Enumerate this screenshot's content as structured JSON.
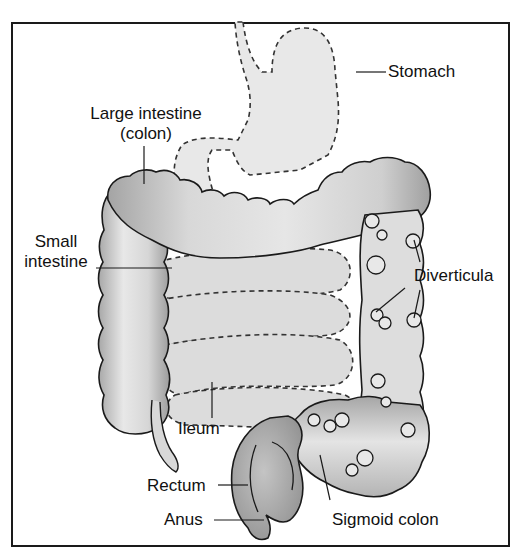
{
  "diagram": {
    "type": "anatomy",
    "labels": {
      "stomach": "Stomach",
      "large_intestine_line1": "Large intestine",
      "large_intestine_line2": "(colon)",
      "small_intestine_line1": "Small",
      "small_intestine_line2": "intestine",
      "diverticula": "Diverticula",
      "ileum": "Ileum",
      "rectum": "Rectum",
      "anus": "Anus",
      "sigmoid_colon": "Sigmoid colon"
    },
    "colors": {
      "frame": "#1a1a1a",
      "organ_fill_light": "#e6e6e6",
      "organ_fill_mid": "#c8c8c8",
      "organ_fill_dark": "#9a9a9a",
      "outline": "#1a1a1a",
      "dashed_outline": "#333333"
    }
  }
}
